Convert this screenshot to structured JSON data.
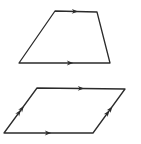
{
  "diagram": {
    "type": "geometry-figures",
    "stroke_color": "#2b2b2b",
    "background": "#ffffff",
    "figures": [
      {
        "name": "trapezoid",
        "vertices": [
          [
            55,
            11
          ],
          [
            97,
            12
          ],
          [
            110,
            63
          ],
          [
            19,
            63
          ]
        ],
        "parallel_marks": [
          {
            "side": "top",
            "arrows": 1,
            "at": [
              75,
              11.5
            ],
            "direction": "right"
          },
          {
            "side": "bottom",
            "arrows": 1,
            "at": [
              70,
              63
            ],
            "direction": "right"
          }
        ]
      },
      {
        "name": "parallelogram",
        "vertices": [
          [
            37,
            88
          ],
          [
            125,
            89
          ],
          [
            93,
            133
          ],
          [
            4,
            133
          ]
        ],
        "parallel_marks": [
          {
            "side": "top",
            "arrows": 1,
            "at": [
              81,
              88.5
            ],
            "direction": "right"
          },
          {
            "side": "bottom",
            "arrows": 1,
            "at": [
              48,
              133
            ],
            "direction": "right"
          },
          {
            "side": "left",
            "arrows": 2,
            "at": [
              20.5,
              110.5
            ],
            "direction": "up-right"
          },
          {
            "side": "right",
            "arrows": 2,
            "at": [
              109,
              111
            ],
            "direction": "up-right"
          }
        ]
      }
    ]
  }
}
